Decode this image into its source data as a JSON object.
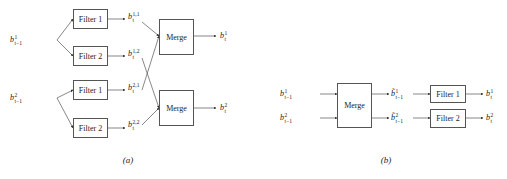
{
  "panel_a": {
    "caption": "(a)",
    "inputs": [
      {
        "base": "b",
        "sup": "1",
        "sub": "t−1"
      },
      {
        "base": "b",
        "sup": "2",
        "sub": "t−1"
      }
    ],
    "filters": [
      {
        "label": "Filter 1"
      },
      {
        "label": "Filter 2"
      },
      {
        "label": "Filter 1"
      },
      {
        "label": "Filter 2"
      }
    ],
    "intermediate": [
      {
        "base": "b",
        "sup": "1,1",
        "sub": "t"
      },
      {
        "base": "b",
        "sup": "1,2",
        "sub": "t"
      },
      {
        "base": "b",
        "sup": "2,1",
        "sub": "t"
      },
      {
        "base": "b",
        "sup": "2,2",
        "sub": "t"
      }
    ],
    "merges": [
      {
        "label": "Merge"
      },
      {
        "label": "Merge"
      }
    ],
    "outputs": [
      {
        "base": "b",
        "sup": "1",
        "sub": "t"
      },
      {
        "base": "b",
        "sup": "2",
        "sub": "t"
      }
    ]
  },
  "panel_b": {
    "caption": "(b)",
    "inputs": [
      {
        "base": "b",
        "sup": "1",
        "sub": "t−1"
      },
      {
        "base": "b",
        "sup": "2",
        "sub": "t−1"
      }
    ],
    "merge": {
      "label": "Merge"
    },
    "merged": [
      {
        "base": "b̃",
        "sup": "1",
        "sub": "t−1"
      },
      {
        "base": "b̃",
        "sup": "2",
        "sub": "t−1"
      }
    ],
    "filters": [
      {
        "label": "Filter 1"
      },
      {
        "label": "Filter 2"
      }
    ],
    "outputs": [
      {
        "base": "b",
        "sup": "1",
        "sub": "t"
      },
      {
        "base": "b",
        "sup": "2",
        "sub": "t"
      }
    ]
  },
  "colors": {
    "line": "#444444",
    "box_border": "#555555",
    "text": "#222222"
  }
}
